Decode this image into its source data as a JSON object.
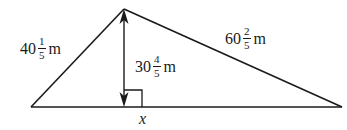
{
  "diagram": {
    "type": "triangle-with-altitude",
    "stroke_color": "#1a1a1a",
    "labels": {
      "left_side": {
        "whole": "40",
        "numerator": "1",
        "denominator": "5",
        "unit": "m"
      },
      "right_side": {
        "whole": "60",
        "numerator": "2",
        "denominator": "5",
        "unit": "m"
      },
      "altitude": {
        "whole": "30",
        "numerator": "4",
        "denominator": "5",
        "unit": "m"
      },
      "foot_variable": "x"
    },
    "markers": {
      "right_angle": "right-angle-marker",
      "altitude_arrows": "double-headed-arrow"
    }
  }
}
